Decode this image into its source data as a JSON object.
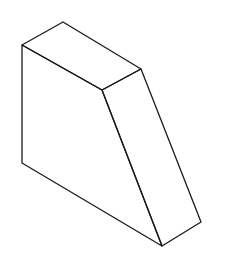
{
  "figure": {
    "stroke_color": "#1a1a1a",
    "background": "#ffffff",
    "vertices": {
      "top_left": [
        22,
        45
      ],
      "top_back": [
        63,
        22
      ],
      "top_right": [
        141,
        69
      ],
      "top_front": [
        102,
        90
      ],
      "bottom_left": [
        22,
        163
      ],
      "bottom_front": [
        162,
        246
      ],
      "bottom_right": [
        201,
        222
      ]
    },
    "faces": {
      "top": "22,45 63,22 141,69 102,90",
      "front_left": "22,45 102,90 162,246 22,163",
      "slanted_right": "102,90 141,69 201,222 162,246"
    }
  }
}
